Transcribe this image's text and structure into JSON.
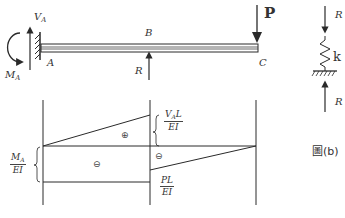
{
  "beam": {
    "label_VA": "V",
    "label_VA_sub": "A",
    "label_MA": "M",
    "label_MA_sub": "A",
    "label_A": "A",
    "label_B": "B",
    "label_C": "C",
    "label_R": "R",
    "load_label": "P"
  },
  "spring": {
    "top_force": "R",
    "stiffness": "k",
    "bottom_force": "R",
    "caption": "圖(b)"
  },
  "diagram": {
    "upper_label_num": "V",
    "upper_label_num_sub": "A",
    "upper_label_num_tail": "L",
    "upper_label_den": "EI",
    "left_label_num": "M",
    "left_label_num_sub": "A",
    "left_label_den": "EI",
    "lower_label_num": "PL",
    "lower_label_den": "EI",
    "sign_positive": "⊕",
    "sign_negative_left": "⊖",
    "sign_negative_right": "⊖"
  },
  "colors": {
    "ink": "#2a2a2a",
    "background": "#ffffff"
  }
}
